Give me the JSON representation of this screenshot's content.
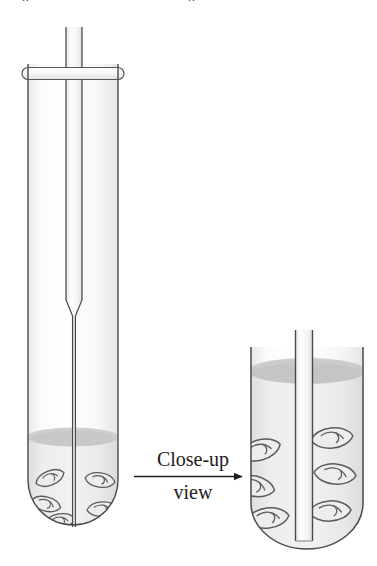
{
  "figure": {
    "background_color": "#ffffff",
    "glass_outline_color": "#3f3f3f",
    "glass_fill_color": "#f4f4f4",
    "liquid_fill_color": "#e2e2e2",
    "liquid_surface_color": "#c9c9c9",
    "seed_outline_color": "#5a5a5a",
    "seed_fill_color": "#ececec",
    "text_color": "#1c1c1c"
  },
  "top_fragments": {
    "left_fragment": "p",
    "right_fragment": "p"
  },
  "caption": {
    "line1": "Close-up",
    "line2": "view",
    "arrow_name": "right-arrow"
  },
  "left_apparatus": {
    "label": "test-tube-full-view",
    "parts": {
      "collar": "rubber-stopper-collar",
      "capillary": "capillary-tube",
      "tube": "test-tube",
      "liquid": "liquid-medium",
      "liquid_surface": "liquid-meniscus",
      "seeds": "germinating-seeds"
    },
    "seed_count": 5
  },
  "right_apparatus": {
    "label": "test-tube-close-up-view",
    "parts": {
      "capillary": "capillary-tube",
      "tube": "test-tube",
      "liquid": "liquid-medium",
      "liquid_surface": "liquid-meniscus",
      "seeds": "germinating-seeds"
    },
    "seed_count": 6
  }
}
